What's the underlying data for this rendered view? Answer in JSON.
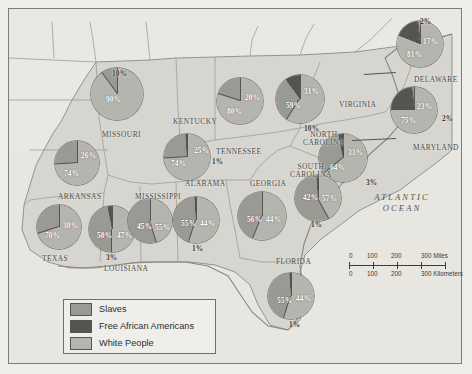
{
  "map": {
    "ocean_label": "ATLANTIC\nOCEAN",
    "ocean_line1": "ATLANTIC",
    "ocean_line2": "OCEAN"
  },
  "legend": {
    "items": [
      {
        "label": "Slaves",
        "color": "#9a9a95"
      },
      {
        "label": "Free African Americans",
        "color": "#545450"
      },
      {
        "label": "White People",
        "color": "#b5b5b0"
      }
    ]
  },
  "scale": {
    "miles": {
      "ticks": [
        "0",
        "100",
        "200",
        "300 Miles"
      ]
    },
    "kilometers": {
      "ticks": [
        "0",
        "100",
        "200",
        "300 Kilometers"
      ]
    }
  },
  "states": [
    {
      "name": "MISSOURI",
      "label_x": 102,
      "label_y": 131,
      "cx": 117,
      "cy": 94,
      "r": 26,
      "slices": [
        {
          "cat": "White People",
          "value": 90,
          "label": "90%",
          "lx": 106,
          "ly": 95,
          "inside": true
        },
        {
          "cat": "Slaves",
          "value": 10,
          "label": "10%",
          "lx": 112,
          "ly": 69,
          "inside": false
        }
      ]
    },
    {
      "name": "ARKANSAS",
      "label_x": 58,
      "label_y": 193,
      "cx": 77,
      "cy": 163,
      "r": 22,
      "slices": [
        {
          "cat": "White People",
          "value": 74,
          "label": "74%",
          "lx": 64,
          "ly": 169,
          "inside": true
        },
        {
          "cat": "Slaves",
          "value": 26,
          "label": "26%",
          "lx": 81,
          "ly": 151,
          "inside": true
        }
      ]
    },
    {
      "name": "TEXAS",
      "label_x": 42,
      "label_y": 255,
      "cx": 59,
      "cy": 227,
      "r": 22,
      "slices": [
        {
          "cat": "White People",
          "value": 70,
          "label": "70%",
          "lx": 45,
          "ly": 231,
          "inside": true
        },
        {
          "cat": "Slaves",
          "value": 30,
          "label": "30%",
          "lx": 63,
          "ly": 221,
          "inside": true
        }
      ]
    },
    {
      "name": "LOUISIANA",
      "label_x": 104,
      "label_y": 265,
      "cx": 112,
      "cy": 229,
      "r": 23,
      "slices": [
        {
          "cat": "White People",
          "value": 50,
          "label": "50%",
          "lx": 97,
          "ly": 231,
          "inside": true
        },
        {
          "cat": "Slaves",
          "value": 47,
          "label": "47%",
          "lx": 117,
          "ly": 231,
          "inside": true
        },
        {
          "cat": "Free African Americans",
          "value": 3,
          "label": "3%",
          "lx": 106,
          "ly": 253,
          "inside": false
        }
      ]
    },
    {
      "name": "MISSISSIPPI",
      "label_x": 135,
      "label_y": 193,
      "cx": 150,
      "cy": 221,
      "r": 22,
      "slices": [
        {
          "cat": "White People",
          "value": 45,
          "label": "45%",
          "lx": 137,
          "ly": 222,
          "inside": true
        },
        {
          "cat": "Slaves",
          "value": 55,
          "label": "55%",
          "lx": 155,
          "ly": 223,
          "inside": true
        }
      ]
    },
    {
      "name": "ALABAMA",
      "label_x": 185,
      "label_y": 180,
      "cx": 196,
      "cy": 220,
      "r": 23,
      "slices": [
        {
          "cat": "White People",
          "value": 55,
          "label": "55%",
          "lx": 181,
          "ly": 219,
          "inside": true
        },
        {
          "cat": "Slaves",
          "value": 44,
          "label": "44%",
          "lx": 200,
          "ly": 219,
          "inside": true
        },
        {
          "cat": "Free African Americans",
          "value": 1,
          "label": "1%",
          "lx": 192,
          "ly": 244,
          "inside": false
        }
      ]
    },
    {
      "name": "TENNESSEE",
      "label_x": 216,
      "label_y": 148,
      "cx": 187,
      "cy": 157,
      "r": 23,
      "slices": [
        {
          "cat": "White People",
          "value": 74,
          "label": "74%",
          "lx": 171,
          "ly": 159,
          "inside": true
        },
        {
          "cat": "Slaves",
          "value": 25,
          "label": "25%",
          "lx": 194,
          "ly": 146,
          "inside": true
        },
        {
          "cat": "Free African Americans",
          "value": 1,
          "label": "1%",
          "lx": 212,
          "ly": 157,
          "inside": false
        }
      ]
    },
    {
      "name": "KENTUCKY",
      "label_x": 173,
      "label_y": 118,
      "cx": 240,
      "cy": 101,
      "r": 23,
      "slices": [
        {
          "cat": "White People",
          "value": 80,
          "label": "80%",
          "lx": 227,
          "ly": 107,
          "inside": true
        },
        {
          "cat": "Slaves",
          "value": 20,
          "label": "20%",
          "lx": 245,
          "ly": 93,
          "inside": true
        }
      ]
    },
    {
      "name": "VIRGINIA",
      "label_x": 339,
      "label_y": 101,
      "cx": 300,
      "cy": 99,
      "r": 24,
      "slices": [
        {
          "cat": "White People",
          "value": 59,
          "label": "59%",
          "lx": 286,
          "ly": 101,
          "inside": true
        },
        {
          "cat": "Slaves",
          "value": 31,
          "label": "31%",
          "lx": 304,
          "ly": 87,
          "inside": true
        },
        {
          "cat": "Free African Americans",
          "value": 10,
          "label": "10%",
          "lx": 304,
          "ly": 124,
          "inside": false
        }
      ]
    },
    {
      "name": "NORTH\nCAROLINA",
      "label_x": 303,
      "label_y": 131,
      "cx": 343,
      "cy": 158,
      "r": 24,
      "slices": [
        {
          "cat": "White People",
          "value": 64,
          "label": "64%",
          "lx": 330,
          "ly": 163,
          "inside": true
        },
        {
          "cat": "Slaves",
          "value": 33,
          "label": "33%",
          "lx": 348,
          "ly": 148,
          "inside": true
        },
        {
          "cat": "Free African Americans",
          "value": 3,
          "label": "3%",
          "lx": 366,
          "ly": 178,
          "inside": false
        }
      ]
    },
    {
      "name": "SOUTH\nCAROLINA",
      "label_x": 290,
      "label_y": 163,
      "cx": 318,
      "cy": 198,
      "r": 23,
      "slices": [
        {
          "cat": "White People",
          "value": 42,
          "label": "42%",
          "lx": 303,
          "ly": 193,
          "inside": true
        },
        {
          "cat": "Slaves",
          "value": 57,
          "label": "57%",
          "lx": 322,
          "ly": 194,
          "inside": true
        },
        {
          "cat": "Free African Americans",
          "value": 1,
          "label": "1%",
          "lx": 311,
          "ly": 220,
          "inside": false
        }
      ]
    },
    {
      "name": "GEORGIA",
      "label_x": 250,
      "label_y": 180,
      "cx": 262,
      "cy": 216,
      "r": 24,
      "slices": [
        {
          "cat": "White People",
          "value": 56,
          "label": "56%",
          "lx": 247,
          "ly": 215,
          "inside": true
        },
        {
          "cat": "Slaves",
          "value": 44,
          "label": "44%",
          "lx": 266,
          "ly": 215,
          "inside": true
        }
      ]
    },
    {
      "name": "FLORIDA",
      "label_x": 276,
      "label_y": 258,
      "cx": 291,
      "cy": 296,
      "r": 23,
      "slices": [
        {
          "cat": "White People",
          "value": 55,
          "label": "55%",
          "lx": 277,
          "ly": 296,
          "inside": true
        },
        {
          "cat": "Slaves",
          "value": 44,
          "label": "44%",
          "lx": 296,
          "ly": 294,
          "inside": true
        },
        {
          "cat": "Free African Americans",
          "value": 1,
          "label": "1%",
          "lx": 289,
          "ly": 320,
          "inside": false
        }
      ]
    },
    {
      "name": "DELAWARE",
      "label_x": 414,
      "label_y": 76,
      "cx": 420,
      "cy": 44,
      "r": 23,
      "slices": [
        {
          "cat": "White People",
          "value": 81,
          "label": "81%",
          "lx": 407,
          "ly": 50,
          "inside": true
        },
        {
          "cat": "Free African Americans",
          "value": 17,
          "label": "17%",
          "lx": 423,
          "ly": 37,
          "inside": true
        },
        {
          "cat": "Slaves",
          "value": 2,
          "label": "2%",
          "lx": 420,
          "ly": 17,
          "inside": false
        }
      ]
    },
    {
      "name": "MARYLAND",
      "label_x": 413,
      "label_y": 144,
      "cx": 414,
      "cy": 110,
      "r": 23,
      "slices": [
        {
          "cat": "White People",
          "value": 75,
          "label": "75%",
          "lx": 401,
          "ly": 116,
          "inside": true
        },
        {
          "cat": "Free African Americans",
          "value": 23,
          "label": "23%",
          "lx": 417,
          "ly": 102,
          "inside": true
        },
        {
          "cat": "Slaves",
          "value": 2,
          "label": "2%",
          "lx": 442,
          "ly": 114,
          "inside": false
        }
      ]
    }
  ]
}
